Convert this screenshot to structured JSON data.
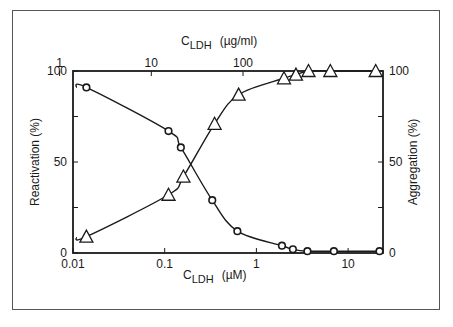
{
  "chart_data": {
    "type": "line",
    "title": "",
    "xlabel": "C_LDH (µM)",
    "xlabel_main": "C",
    "xlabel_sub": "LDH",
    "xlabel_unit": "(µM)",
    "x2label_main": "C",
    "x2label_sub": "LDH",
    "x2label_unit": "(µg/ml)",
    "ylabel": "Reactivation (%)",
    "y2label": "Aggregation (%)",
    "xscale": "log",
    "xlim": [
      0.01,
      25
    ],
    "ylim": [
      0,
      100
    ],
    "x_ticks": [
      "0.01",
      "0.1",
      "1",
      "10"
    ],
    "x2_ticks": [
      "1",
      "10",
      "100"
    ],
    "y_ticks": [
      "0",
      "50",
      "100"
    ],
    "y2_ticks": [
      "0",
      "50",
      "100"
    ],
    "grid": false,
    "series": [
      {
        "name": "Reactivation",
        "marker": "circle",
        "axis": "left",
        "x": [
          0.014,
          0.11,
          0.15,
          0.33,
          0.62,
          1.9,
          2.5,
          3.6,
          7.0,
          22
        ],
        "values": [
          91,
          67,
          58,
          29,
          12,
          4,
          2,
          1,
          1,
          1
        ]
      },
      {
        "name": "Aggregation",
        "marker": "triangle",
        "axis": "right",
        "x": [
          0.014,
          0.11,
          0.16,
          0.35,
          0.64,
          2.0,
          2.7,
          3.7,
          6.4,
          20
        ],
        "values": [
          9,
          32,
          42,
          71,
          87,
          96,
          98,
          100,
          100,
          100
        ]
      }
    ]
  }
}
